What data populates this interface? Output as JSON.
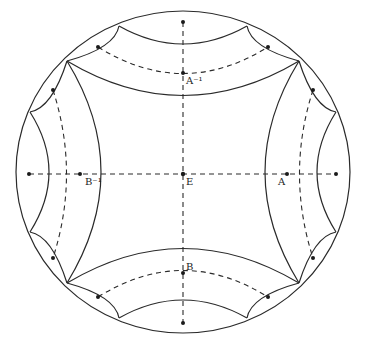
{
  "diagram": {
    "labels": {
      "E": "E",
      "A": "A",
      "A_inv": "A⁻¹",
      "B": "B",
      "B_inv": "B⁻¹"
    },
    "colors": {
      "stroke": "#2a2a2a",
      "background": "#ffffff"
    }
  }
}
